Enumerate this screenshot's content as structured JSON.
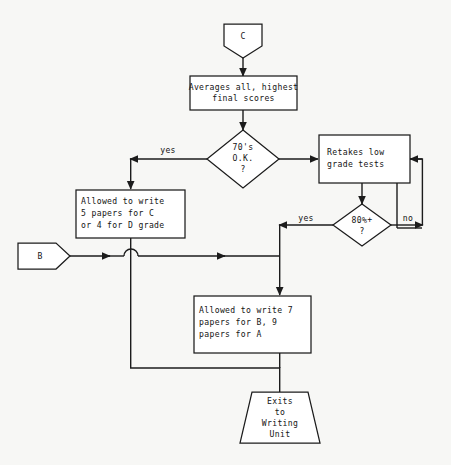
{
  "diagram": {
    "background_color": "#f7f7f5",
    "line_color": "#1c1c1c",
    "shape_fill": "#ffffff",
    "text_color": "#141414"
  },
  "nodes": {
    "connector_c": {
      "shape": "pentagon-connector",
      "label": "C"
    },
    "averages": {
      "shape": "process",
      "line1": "Averages all, highest",
      "line2": "final scores"
    },
    "decision_70": {
      "shape": "decision",
      "line1": "70's",
      "line2": "O.K.",
      "line3": "?"
    },
    "retakes": {
      "shape": "process",
      "line1": "Retakes low",
      "line2": "grade tests"
    },
    "allowed_cd": {
      "shape": "process",
      "line1": "Allowed to write",
      "line2": "5 papers for C",
      "line3": "or 4 for D grade"
    },
    "decision_80": {
      "shape": "decision",
      "line1": "80%+",
      "line2": "?"
    },
    "connector_b": {
      "shape": "pentagon-connector",
      "label": "B"
    },
    "allowed_ab": {
      "shape": "process",
      "line1": "Allowed to write 7",
      "line2": "papers for B, 9",
      "line3": "papers for A"
    },
    "exits": {
      "shape": "trapezoid-terminator",
      "line1": "Exits",
      "line2": "to",
      "line3": "Writing",
      "line4": "Unit"
    }
  },
  "edge_labels": {
    "yes_70": "yes",
    "yes_80": "yes",
    "no_80": "no"
  }
}
